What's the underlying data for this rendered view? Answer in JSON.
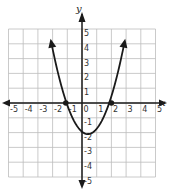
{
  "chart_data": {
    "type": "line",
    "title": "",
    "xlabel": "x",
    "ylabel": "y",
    "xlim": [
      -5,
      5
    ],
    "ylim": [
      -5,
      5
    ],
    "grid": true,
    "x_ticks": [
      "-5",
      "-4",
      "-3",
      "-2",
      "-1",
      "0",
      "1",
      "2",
      "3",
      "4",
      "5"
    ],
    "y_ticks": [
      "5",
      "4",
      "3",
      "2",
      "1",
      "-1",
      "-2",
      "-3",
      "-4",
      "-5"
    ],
    "series": [
      {
        "name": "parabola",
        "equation_estimate": "y = (x - 0.4)^2 - 2.1",
        "x": [
          -2.1,
          -1.5,
          -1.0,
          -0.5,
          0,
          0.4,
          1.0,
          1.5,
          2.0,
          2.5,
          2.9
        ],
        "y": [
          4.15,
          1.51,
          -0.14,
          -1.29,
          -1.94,
          -2.1,
          -1.74,
          -0.89,
          0.46,
          2.31,
          4.15
        ],
        "arrows_at_ends": true
      }
    ],
    "marked_points": [
      {
        "x": -1.1,
        "y": 0,
        "label": ""
      },
      {
        "x": 2.0,
        "y": 0,
        "label": ""
      }
    ],
    "colors": {
      "curve": "#1a1a1a",
      "grid": "#bdbdbd",
      "axes": "#1a1a1a"
    }
  },
  "labels": {
    "x_axis": "x",
    "y_axis": "y"
  }
}
